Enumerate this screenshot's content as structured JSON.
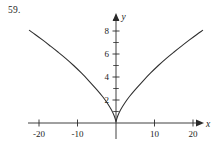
{
  "figure": {
    "problem_number": "59.",
    "background_color": "#ffffff",
    "ink_color": "#2a2a2a"
  },
  "chart_data": {
    "type": "line",
    "title": "",
    "subtitle": "",
    "xlabel": "x",
    "ylabel": "y",
    "grid": false,
    "legend": false,
    "xlim": [
      -26,
      26
    ],
    "ylim": [
      -1,
      9.2
    ],
    "xticks": [
      -20,
      -10,
      10,
      20
    ],
    "xtick_labels": [
      "-20",
      "-10",
      "10",
      "20"
    ],
    "yticks": [
      2,
      4,
      6,
      8
    ],
    "ytick_labels": [
      "2",
      "4",
      "6",
      "8"
    ],
    "yminorticks": [
      1,
      3,
      5,
      7,
      9
    ],
    "axis_arrows": [
      "x-positive",
      "y-positive"
    ],
    "series": [
      {
        "name": "curve",
        "description": "symmetric cusp curve opening upward with rounded vertex at the origin",
        "x": [
          -22.5,
          -21,
          -19,
          -17,
          -15,
          -13,
          -11,
          -9,
          -7,
          -5,
          -3.5,
          -2.2,
          -1.2,
          -0.5,
          -0.15,
          0,
          0.15,
          0.5,
          1.2,
          2.2,
          3.5,
          5,
          7,
          9,
          11,
          13,
          15,
          17,
          19,
          21,
          22.5
        ],
        "y": [
          8.05,
          7.7,
          7.2,
          6.68,
          6.15,
          5.6,
          5.0,
          4.35,
          3.65,
          2.9,
          2.3,
          1.7,
          1.15,
          0.65,
          0.3,
          0.1,
          0.3,
          0.65,
          1.15,
          1.7,
          2.3,
          2.9,
          3.65,
          4.35,
          5.0,
          5.6,
          6.15,
          6.68,
          7.2,
          7.7,
          8.05
        ]
      }
    ]
  }
}
